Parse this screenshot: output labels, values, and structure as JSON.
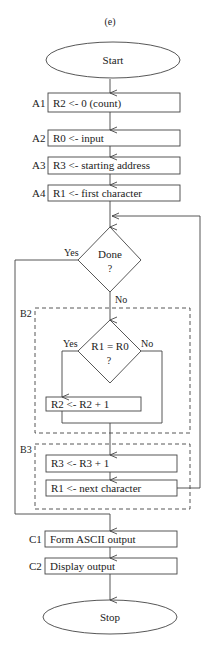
{
  "figure_label": "(e)",
  "colors": {
    "stroke": "#444444",
    "text": "#222222",
    "background": "#ffffff"
  },
  "nodes": {
    "start": {
      "label": "Start",
      "shape": "ellipse"
    },
    "a1": {
      "step": "A1",
      "label": "R2 <- 0 (count)"
    },
    "a2": {
      "step": "A2",
      "label": "R0 <- input"
    },
    "a3": {
      "step": "A3",
      "label": "R3 <- starting address"
    },
    "a4": {
      "step": "A4",
      "label": "R1 <- first character"
    },
    "done": {
      "line1": "Done",
      "line2": "?",
      "yes": "Yes",
      "no": "No"
    },
    "b2": {
      "group": "B2"
    },
    "compare": {
      "line1": "R1 = R0",
      "line2": "?",
      "yes": "Yes",
      "no": "No"
    },
    "increment_count": {
      "label": "R2 <- R2 + 1"
    },
    "b3": {
      "group": "B3"
    },
    "increment_addr": {
      "label": "R3 <- R3 + 1"
    },
    "next_char": {
      "label": "R1 <- next character"
    },
    "c1": {
      "step": "C1",
      "label": "Form ASCII output"
    },
    "c2": {
      "step": "C2",
      "label": "Display output"
    },
    "stop": {
      "label": "Stop",
      "shape": "ellipse"
    }
  }
}
